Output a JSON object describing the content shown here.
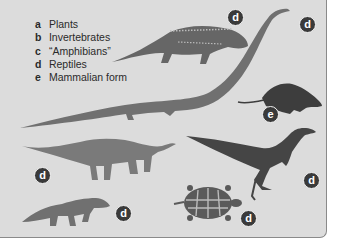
{
  "legend": {
    "items": [
      {
        "key": "a",
        "label": "Plants"
      },
      {
        "key": "b",
        "label": "Invertebrates"
      },
      {
        "key": "c",
        "label": "“Amphibians”"
      },
      {
        "key": "d",
        "label": "Reptiles"
      },
      {
        "key": "e",
        "label": "Mammalian form"
      }
    ]
  },
  "figures": [
    {
      "name": "armored-reptile",
      "badge": "d"
    },
    {
      "name": "long-neck-reptile",
      "badge": "d"
    },
    {
      "name": "mammalian-form-rodent",
      "badge": "e"
    },
    {
      "name": "sauropod",
      "badge": "d"
    },
    {
      "name": "theropod",
      "badge": "d"
    },
    {
      "name": "small-quadruped-reptile",
      "badge": "d"
    },
    {
      "name": "tortoise",
      "badge": "d"
    }
  ],
  "colors": {
    "panel_bg": "#dcdcdc",
    "silhouette_mid": "#6e6e6e",
    "silhouette_dark": "#454545",
    "badge_bg": "#3a3a3a"
  }
}
